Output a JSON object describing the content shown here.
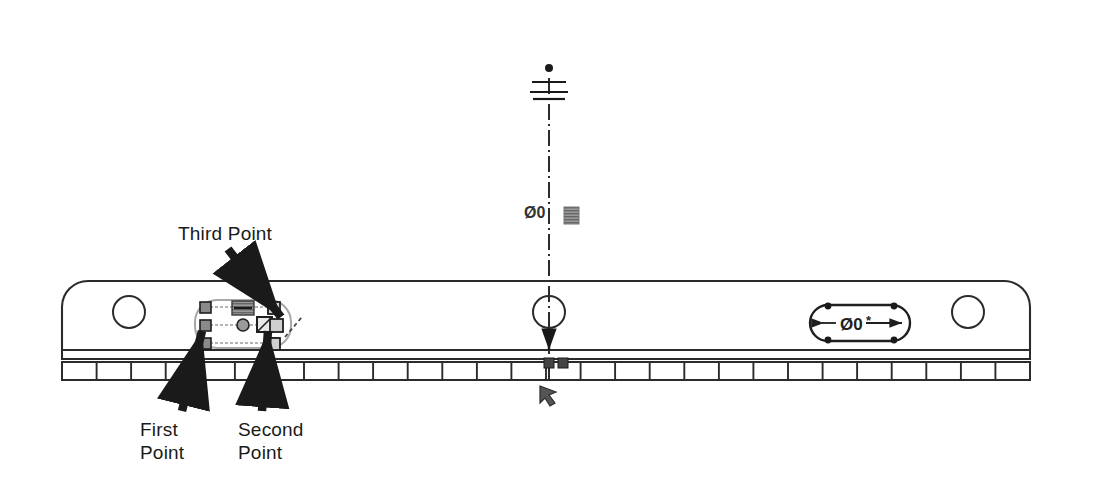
{
  "page": {
    "width": 1095,
    "height": 486,
    "background": "#ffffff",
    "kind": "cad-technical-drawing-screenshot"
  },
  "colors": {
    "ink": "#1a1a1a",
    "line": "#2b2b2b",
    "grip_fill": "#8a8a8a",
    "grip_stroke": "#1f1f1f",
    "selection_dash": "#9a9a9a",
    "hot_grip": "#555555",
    "background": "#ffffff"
  },
  "annotations": {
    "callouts": [
      {
        "id": "third-point",
        "text": "Third Point",
        "x": 178,
        "y": 222
      },
      {
        "id": "first-point",
        "text": "First\nPoint",
        "x": 140,
        "y": 418
      },
      {
        "id": "second-point",
        "text": "Second\nPoint",
        "x": 238,
        "y": 418
      }
    ],
    "arrows": [
      {
        "id": "third-point-arrow",
        "from": [
          228,
          248
        ],
        "to": [
          282,
          318
        ],
        "points_at": "third-point"
      },
      {
        "id": "first-point-arrow",
        "from": [
          182,
          412
        ],
        "to": [
          205,
          330
        ],
        "points_at": "first-point"
      },
      {
        "id": "second-point-arrow",
        "from": [
          260,
          412
        ],
        "to": [
          270,
          330
        ],
        "points_at": "second-point"
      }
    ]
  },
  "part": {
    "name": "long-rail-part-outline",
    "top_edge_y": 281,
    "bottom_edge_y": 350,
    "left_x": 62,
    "right_x": 1030,
    "corner_radius": 26,
    "holes": [
      {
        "id": "left-hole",
        "cx": 129,
        "cy": 312,
        "r": 16
      },
      {
        "id": "right-hole",
        "cx": 968,
        "cy": 312,
        "r": 16
      }
    ]
  },
  "band": {
    "name": "segmented-bottom-band",
    "thin_strip": {
      "y_top": 350,
      "y_bottom": 359
    },
    "segment_strip": {
      "y_top": 362,
      "y_bottom": 380
    },
    "left_x": 62,
    "right_x": 1030,
    "segment_count": 28
  },
  "centerline": {
    "name": "vertical-centerline",
    "x": 549,
    "y_top": 70,
    "y_bottom": 380,
    "style": "dash-dot",
    "top_symbol": "datum-grip-symbol",
    "circle": {
      "cx": 549,
      "cy": 312,
      "r": 16
    },
    "down_arrow_y": 345
  },
  "center_dimension": {
    "name": "center-diameter-dimension",
    "text": "Ø0",
    "x": 524,
    "y": 211,
    "swatch": {
      "x": 564,
      "y": 208,
      "w": 14,
      "h": 16
    }
  },
  "slot_dimension": {
    "name": "slot-diameter-dimension",
    "text": "Ø0",
    "x": 840,
    "y": 320,
    "slot": {
      "cx": 860,
      "cy": 323,
      "w": 100,
      "h": 36,
      "r": 18
    },
    "arrow_left_x": 822,
    "arrow_right_x": 902
  },
  "selected_entity": {
    "name": "selected-slot-with-grips",
    "slot": {
      "cx": 243,
      "cy": 322,
      "w": 96,
      "h": 44,
      "r": 20
    },
    "grips": [
      {
        "id": "grip-top-left",
        "x": 205,
        "y": 307,
        "state": "cold"
      },
      {
        "id": "grip-mid-left",
        "x": 205,
        "y": 325,
        "state": "cold"
      },
      {
        "id": "grip-bottom-left",
        "x": 205,
        "y": 343,
        "state": "cold"
      },
      {
        "id": "grip-top-right",
        "x": 273,
        "y": 307,
        "state": "cold"
      },
      {
        "id": "grip-mid-right",
        "x": 273,
        "y": 325,
        "state": "cold"
      },
      {
        "id": "grip-bottom-right",
        "x": 273,
        "y": 343,
        "state": "cold"
      },
      {
        "id": "grip-center",
        "x": 243,
        "y": 325,
        "state": "circle"
      }
    ],
    "hot_marker": {
      "x": 232,
      "y": 303,
      "w": 20,
      "h": 13
    },
    "cursor_icons": [
      {
        "id": "pick-box-cursor",
        "x": 258,
        "y": 318
      },
      {
        "id": "drag-handle-icon",
        "x": 268,
        "y": 322
      }
    ],
    "rubber_band": {
      "from": [
        286,
        334
      ],
      "to": [
        300,
        318
      ]
    }
  },
  "cursors": {
    "bottom_arrow_cursor": {
      "id": "arrow-cursor-icon",
      "x": 541,
      "y": 388,
      "w": 18,
      "h": 18
    }
  }
}
